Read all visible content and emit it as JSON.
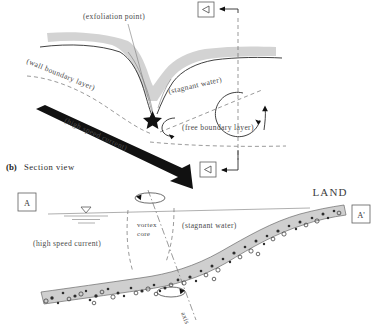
{
  "figure": {
    "caption_marker": "(b)",
    "caption_text": "Section view"
  },
  "panel_top": {
    "name": "plan-view-panel",
    "labels": {
      "exfoliation_point": "(exfoliation point)",
      "wall_boundary_layer": "(wall boundary layer)",
      "stagnant_water": "(stagnant water)",
      "free_boundary_layer": "(free boundary layer)",
      "high_speed_current": "(high speed current)"
    },
    "markers": {
      "section_top": "◁",
      "section_bottom": "◁"
    },
    "icons": {
      "exfoliation_star": "star-icon",
      "small_vortex": "small-vortex-arrow-icon",
      "large_vortex": "large-vortex-arrow-icon",
      "flow_arrow": "high-speed-current-arrow-icon"
    }
  },
  "panel_bottom": {
    "name": "section-view-panel",
    "labels": {
      "land": "LAND",
      "vortex_core_line1": "vortex",
      "vortex_core_line2": "core",
      "stagnant_water": "(stagnant water)",
      "high_speed_current": "(high speed current)",
      "axis": "axis"
    },
    "markers": {
      "left": "A",
      "right": "A'"
    },
    "icons": {
      "water_surface": "water-surface-icon",
      "rotation_top": "rotation-arrow-icon",
      "rotation_bottom": "rotation-arrow-icon"
    }
  },
  "colors": {
    "background": "#ffffff",
    "band_gray": "#d3d3d3",
    "ink": "#2b2b2b",
    "label": "#4a4a4a"
  }
}
